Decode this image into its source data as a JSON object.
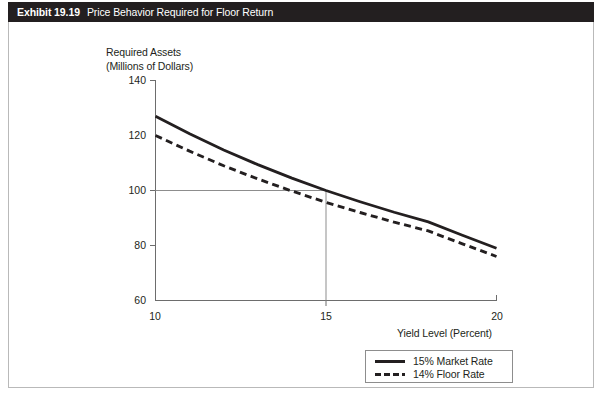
{
  "header": {
    "exhibit_number": "Exhibit 19.19",
    "exhibit_title": "Price Behavior Required for Floor Return"
  },
  "chart_data": {
    "type": "line",
    "title": "Price Behavior Required for Floor Return",
    "xlabel": "Yield Level (Percent)",
    "ylabel": "Required Assets\n(Millions of Dollars)",
    "ylabel_line1": "Required Assets",
    "ylabel_line2": "(Millions of Dollars)",
    "xlim": [
      10,
      20
    ],
    "ylim": [
      60,
      140
    ],
    "xticks": [
      "10",
      "15",
      "20"
    ],
    "yticks": [
      "140",
      "120",
      "100",
      "80",
      "60"
    ],
    "grid": false,
    "legend_position": "bottom-right",
    "x": [
      10,
      11,
      12,
      13,
      14,
      15,
      16,
      17,
      18,
      19,
      20
    ],
    "series": [
      {
        "name": "15% Market Rate",
        "style": "solid",
        "color": "#231f20",
        "values": [
          127.0,
          120.6,
          114.7,
          109.4,
          104.5,
          100.0,
          95.9,
          92.1,
          88.6,
          83.7,
          79.0
        ]
      },
      {
        "name": "14% Floor Rate",
        "style": "dashed",
        "color": "#231f20",
        "values": [
          120.0,
          114.3,
          109.0,
          104.2,
          99.8,
          95.7,
          92.0,
          88.5,
          85.3,
          80.6,
          76.0
        ]
      }
    ],
    "reference_lines": [
      {
        "name": "horizontal-100",
        "orientation": "horizontal",
        "value": 100,
        "from_x": 10,
        "to_x": 15,
        "color": "#8d8d8d"
      },
      {
        "name": "vertical-15",
        "orientation": "vertical",
        "value": 15,
        "from_y": 60,
        "to_y": 100,
        "color": "#8d8d8d"
      }
    ],
    "annotations": []
  },
  "legend": {
    "items": [
      {
        "label": "15% Market Rate",
        "style": "solid"
      },
      {
        "label": "14% Floor Rate",
        "style": "dashed"
      }
    ]
  }
}
